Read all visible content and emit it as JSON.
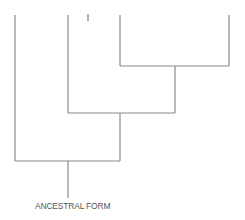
{
  "diagram": {
    "type": "cladogram",
    "root_label": "ANCESTRAL FORM",
    "line_color": "#8a8a8a",
    "label_color": "#555555",
    "tips": [
      {
        "id": "tip-1",
        "x": 15,
        "label": ""
      },
      {
        "id": "tip-2",
        "x": 68,
        "label": ""
      },
      {
        "id": "tip-3",
        "x": 120,
        "label": ""
      },
      {
        "id": "tip-4",
        "x": 229,
        "label": ""
      }
    ],
    "nodes": [
      {
        "id": "node-3-4",
        "y": 66,
        "x1": 120,
        "x2": 229,
        "stem_x": 175
      },
      {
        "id": "node-2-34",
        "y": 113,
        "x1": 68,
        "x2": 175,
        "stem_x": 120
      },
      {
        "id": "node-1-234",
        "y": 161,
        "x1": 15,
        "x2": 120,
        "stem_x": 68
      }
    ]
  }
}
